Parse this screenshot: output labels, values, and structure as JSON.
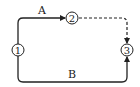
{
  "diagram": {
    "nodes": [
      {
        "id": "1",
        "label": "1",
        "glyph": "①"
      },
      {
        "id": "2",
        "label": "2",
        "glyph": "②"
      },
      {
        "id": "3",
        "label": "3",
        "glyph": "③"
      }
    ],
    "edges": [
      {
        "from": "1",
        "to": "2",
        "label": "A",
        "style": "solid"
      },
      {
        "from": "2",
        "to": "3",
        "label": "",
        "style": "dashed"
      },
      {
        "from": "1",
        "to": "3",
        "label": "B",
        "style": "solid"
      }
    ],
    "colors": {
      "stroke": "#222222",
      "background": "#ffffff"
    }
  }
}
